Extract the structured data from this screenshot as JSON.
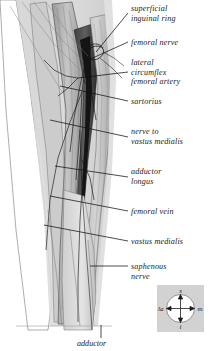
{
  "figure": {
    "background_color": "#ffffff",
    "tone_light": "#d8d8d8",
    "tone_mid": "#b4b4b4",
    "tone_dark": "#6e6e6e",
    "tone_darkest": "#1f1f1f",
    "line_color": "#141414"
  },
  "labels": [
    {
      "id": "superficial-inguinal-ring",
      "text": "superficial\ninguinal ring",
      "x": 131,
      "y": 4,
      "leader": {
        "x1": 128,
        "y1": 13,
        "x2": 96,
        "y2": 52
      }
    },
    {
      "id": "femoral-nerve",
      "text": "femoral nerve",
      "x": 131,
      "y": 38,
      "leader": {
        "x1": 128,
        "y1": 42,
        "x2": 86,
        "y2": 61
      }
    },
    {
      "id": "lateral-circumflex-femoral-artery",
      "text": "lateral\ncircumflex\nfemoral artery",
      "x": 131,
      "y": 58,
      "leader": {
        "x1": 128,
        "y1": 72,
        "x2": 78,
        "y2": 78
      }
    },
    {
      "id": "sartorius",
      "text": "sartorius",
      "x": 131,
      "y": 97,
      "leader": {
        "x1": 128,
        "y1": 101,
        "x2": 60,
        "y2": 86
      }
    },
    {
      "id": "nerve-to-vastus-medialis",
      "text": "nerve to\nvastus medialis",
      "x": 131,
      "y": 127,
      "leader": {
        "x1": 128,
        "y1": 137,
        "x2": 50,
        "y2": 120
      }
    },
    {
      "id": "adductor-longus",
      "text": "adductor\nlongus",
      "x": 131,
      "y": 167,
      "leader": {
        "x1": 128,
        "y1": 177,
        "x2": 55,
        "y2": 166
      }
    },
    {
      "id": "femoral-vein",
      "text": "femoral vein",
      "x": 131,
      "y": 207,
      "leader": {
        "x1": 128,
        "y1": 211,
        "x2": 50,
        "y2": 196
      }
    },
    {
      "id": "vastus-medialis",
      "text": "vastus medialis",
      "x": 131,
      "y": 237,
      "leader": {
        "x1": 128,
        "y1": 241,
        "x2": 44,
        "y2": 225
      }
    },
    {
      "id": "saphenous-nerve",
      "text": "saphenous\nnerve",
      "x": 131,
      "y": 262,
      "leader": {
        "x1": 128,
        "y1": 266,
        "x2": 90,
        "y2": 266
      }
    }
  ],
  "bottom_caption": {
    "id": "adductor",
    "text": "adductor",
    "x": 77,
    "y": 339,
    "leader": {
      "x1": 101,
      "y1": 325,
      "x2": 101,
      "y2": 338
    }
  },
  "compass": {
    "superior": "s",
    "inferior": "i",
    "lateral": "la",
    "medial": "m",
    "box": {
      "x": 157,
      "y": 285,
      "width": 47,
      "height": 47
    },
    "background_color": "#d2d2d2"
  }
}
